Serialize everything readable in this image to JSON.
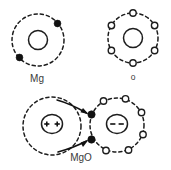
{
  "figure": {
    "canvas": {
      "width": 171,
      "height": 170
    },
    "colors": {
      "background": "#ffffff",
      "stroke": "#1d1d1d",
      "electron_filled": "#111111",
      "electron_open_fill": "#ffffff",
      "label_text": "#3a3a3a"
    }
  },
  "panels": {
    "mg_atom": {
      "label": "Mg",
      "label_pos": {
        "x": 37,
        "y": 79
      },
      "shell": {
        "cx": 38,
        "cy": 40,
        "r": 26
      },
      "nucleus": {
        "cx": 38,
        "cy": 40,
        "r": 9.5
      },
      "electron_count": 2,
      "electron_type": "filled",
      "electrons": [
        {
          "x": 57.5,
          "y": 23.5,
          "type": "filled",
          "r": 3.4
        },
        {
          "x": 19.5,
          "y": 57.5,
          "type": "filled",
          "r": 3.4
        }
      ]
    },
    "o_atom": {
      "label": "o",
      "label_pos": {
        "x": 133,
        "y": 77
      },
      "shell": {
        "cx": 133,
        "cy": 38,
        "r": 25
      },
      "nucleus": {
        "cx": 133,
        "cy": 38,
        "r": 9.5
      },
      "electron_count": 6,
      "electron_type": "open",
      "electrons": [
        {
          "x": 133,
          "y": 13,
          "type": "open",
          "r": 3.2
        },
        {
          "x": 154.6,
          "y": 25.5,
          "type": "open",
          "r": 3.2
        },
        {
          "x": 154.6,
          "y": 50.5,
          "type": "open",
          "r": 3.2
        },
        {
          "x": 133,
          "y": 63,
          "type": "open",
          "r": 3.2
        },
        {
          "x": 111.4,
          "y": 50.5,
          "type": "open",
          "r": 3.2
        },
        {
          "x": 111.4,
          "y": 25.5,
          "type": "open",
          "r": 3.2
        }
      ]
    },
    "mgo_compound": {
      "label": "MgO",
      "label_pos": {
        "x": 81,
        "y": 158
      },
      "mg_ion": {
        "charge": "2+",
        "charge_marks": "++",
        "shell": {
          "cx": 52,
          "cy": 126,
          "r": 29
        },
        "nucleus": {
          "cx": 52,
          "cy": 124,
          "rx": 10.5,
          "ry": 9.5
        },
        "electron_count": 0
      },
      "o_ion": {
        "charge": "2-",
        "charge_marks": "--",
        "shell": {
          "cx": 117,
          "cy": 125,
          "r": 27
        },
        "nucleus": {
          "cx": 117,
          "cy": 124,
          "rx": 10.5,
          "ry": 9.5
        },
        "electron_count": 8,
        "transferred_electron_count": 2,
        "electrons": [
          {
            "x": 91.5,
            "y": 114.5,
            "type": "filled",
            "r": 3.7
          },
          {
            "x": 91.5,
            "y": 139.5,
            "type": "filled",
            "r": 3.7
          },
          {
            "x": 103.5,
            "y": 101.0,
            "type": "open",
            "r": 3.2
          },
          {
            "x": 125.5,
            "y": 98.8,
            "type": "open",
            "r": 3.2
          },
          {
            "x": 141.5,
            "y": 112.5,
            "type": "open",
            "r": 3.2
          },
          {
            "x": 143.0,
            "y": 134.5,
            "type": "open",
            "r": 3.2
          },
          {
            "x": 128.5,
            "y": 150.0,
            "type": "open",
            "r": 3.2
          },
          {
            "x": 106.0,
            "y": 150.5,
            "type": "open",
            "r": 3.2
          }
        ]
      },
      "arrows": [
        {
          "name": "electron-transfer-arrow-upper",
          "from": {
            "x": 57,
            "y": 100
          },
          "to": {
            "x": 88.5,
            "y": 113
          }
        },
        {
          "name": "electron-transfer-arrow-lower",
          "from": {
            "x": 58,
            "y": 152
          },
          "to": {
            "x": 88.5,
            "y": 141
          }
        }
      ]
    }
  }
}
